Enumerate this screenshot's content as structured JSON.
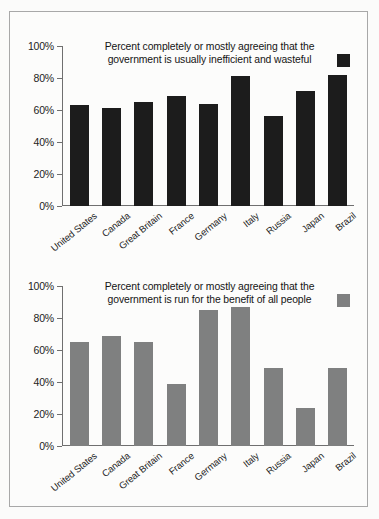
{
  "figure": {
    "background_color": "#fcfcfb",
    "border_color": "#a8a8a8",
    "caption": ""
  },
  "chart_data": [
    {
      "type": "bar",
      "id": "inefficient-wasteful",
      "title": "Percent completely or mostly agreeing that the government is usually inefficient and wasteful",
      "title_line1": "Percent completely or mostly agreeing that the",
      "title_line2": "government is usually inefficient and wasteful",
      "xlabel": "",
      "ylabel": "",
      "ylim": [
        0,
        100
      ],
      "ytick_labels": [
        "100%",
        "80%",
        "60%",
        "40%",
        "20%",
        "0%"
      ],
      "yticks": [
        100,
        80,
        60,
        40,
        20,
        0
      ],
      "grid": false,
      "legend_position": "title-right",
      "series_color": "#1c1c1c",
      "categories": [
        "United States",
        "Canada",
        "Great Britain",
        "France",
        "Germany",
        "Italy",
        "Russia",
        "Japan",
        "Brazil"
      ],
      "values": [
        63,
        61,
        65,
        69,
        64,
        81,
        56,
        72,
        82
      ]
    },
    {
      "type": "bar",
      "id": "benefit-of-all-people",
      "title": "Percent completely or mostly agreeing that the government is run for the benefit of all people",
      "title_line1": "Percent completely or mostly agreeing that the",
      "title_line2": "government is run for the benefit of all people",
      "xlabel": "",
      "ylabel": "",
      "ylim": [
        0,
        100
      ],
      "ytick_labels": [
        "100%",
        "80%",
        "60%",
        "40%",
        "20%",
        "0%"
      ],
      "yticks": [
        100,
        80,
        60,
        40,
        20,
        0
      ],
      "grid": false,
      "legend_position": "title-right",
      "series_color": "#7f8080",
      "categories": [
        "United States",
        "Canada",
        "Great Britain",
        "France",
        "Germany",
        "Italy",
        "Russia",
        "Japan",
        "Brazil"
      ],
      "values": [
        65,
        69,
        65,
        39,
        85,
        87,
        49,
        24,
        49
      ]
    }
  ]
}
